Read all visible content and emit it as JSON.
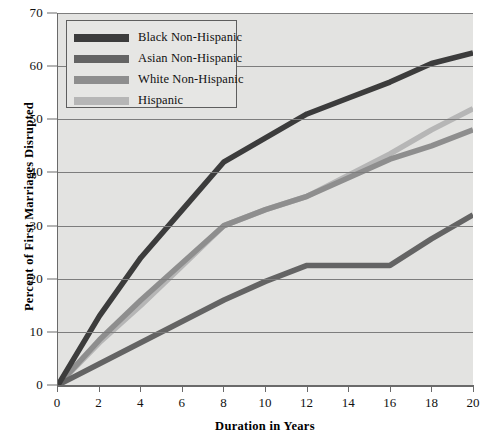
{
  "chart_data": {
    "type": "line",
    "title": "",
    "xlabel": "Duration in Years",
    "ylabel": "Percent of First Marriages Disrupted",
    "xlim": [
      0,
      20
    ],
    "ylim": [
      0,
      70
    ],
    "xticks": [
      0,
      2,
      4,
      6,
      8,
      10,
      12,
      14,
      16,
      18,
      20
    ],
    "yticks": [
      0,
      10,
      20,
      30,
      40,
      50,
      60,
      70
    ],
    "grid": "horizontal",
    "legend_position": "top-left",
    "x": [
      0,
      2,
      4,
      6,
      8,
      10,
      12,
      14,
      16,
      18,
      20
    ],
    "series": [
      {
        "name": "Black Non-Hispanic",
        "color": "#3c3c3c",
        "values": [
          0,
          13,
          24,
          33,
          42,
          46.5,
          51,
          54,
          57,
          60.5,
          62.5
        ]
      },
      {
        "name": "Asian Non-Hispanic",
        "color": "#646464",
        "values": [
          0,
          4,
          8,
          12,
          16,
          19.5,
          22.5,
          22.5,
          22.5,
          27.5,
          32
        ]
      },
      {
        "name": "White Non-Hispanic",
        "color": "#8e8e8e",
        "values": [
          0,
          8.5,
          16,
          23,
          30,
          33,
          35.5,
          39,
          42.5,
          45,
          48
        ]
      },
      {
        "name": "Hispanic",
        "color": "#b6b6b6",
        "values": [
          0,
          8,
          15,
          22.5,
          30,
          33,
          35.5,
          39.5,
          43.5,
          48,
          52
        ]
      }
    ]
  },
  "axes": {
    "y_title": "Percent of First Marriages Disrupted",
    "x_title": "Duration in Years",
    "y_tick_labels": [
      "70",
      "60",
      "50",
      "40",
      "30",
      "20",
      "10",
      "0"
    ],
    "x_tick_labels": [
      "0",
      "2",
      "4",
      "6",
      "8",
      "10",
      "12",
      "14",
      "16",
      "18",
      "20"
    ]
  },
  "legend": {
    "items": [
      {
        "label": "Black Non-Hispanic",
        "color": "#3c3c3c"
      },
      {
        "label": "Asian Non-Hispanic",
        "color": "#646464"
      },
      {
        "label": "White Non-Hispanic",
        "color": "#8e8e8e"
      },
      {
        "label": "Hispanic",
        "color": "#b6b6b6"
      }
    ]
  },
  "colors": {
    "plot_background": "#e3e3e1",
    "gridline": "#7d7d7d",
    "axis": "#6a6a6a",
    "legend_background": "#e6e6e4",
    "legend_border": "#5e5e5e"
  }
}
